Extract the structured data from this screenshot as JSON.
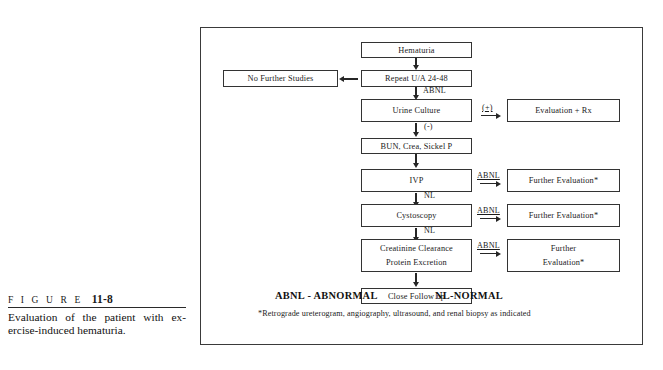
{
  "caption": {
    "figure_word": "F I G U R E",
    "figure_number": "11-8",
    "text": "Evaluation of the patient with ex-ercise-induced hematuria."
  },
  "flowchart": {
    "title": "Evaluation of exercise-induced hematuria",
    "nodes": {
      "hematuria": "Hematuria",
      "repeat_ua": "Repeat U/A 24-48",
      "no_further_studies": "No Further Studies",
      "urine_culture": "Urine Culture",
      "evaluation_rx": "Evaluation + Rx",
      "bun_crea": "BUN, Crea, Sickel P",
      "ivp": "IVP",
      "further_eval_ivp": "Further Evaluation*",
      "cystoscopy": "Cystoscopy",
      "further_eval_cysto": "Further Evaluation*",
      "creatinine_clearance_l1": "Creatinine Clearance",
      "creatinine_clearance_l2": "Protein Excretion",
      "further_eval_creat_l1": "Further",
      "further_eval_creat_l2": "Evaluation*",
      "close_follow_up": "Close Follow up"
    },
    "edge_labels": {
      "abnl_repeat": "ABNL",
      "positive": "(+)",
      "negative": "(-)",
      "abnl_ivp": "ABNL",
      "nl_ivp": "NL",
      "abnl_cysto": "ABNL",
      "nl_cysto": "NL",
      "abnl_creat": "ABNL"
    }
  },
  "legend": {
    "abnl": "ABNL - ABNORMAL",
    "nl": "NL-NORMAL",
    "footnote": "*Retrograde ureterogram, angiography, ultrasound, and renal biopsy as indicated"
  }
}
